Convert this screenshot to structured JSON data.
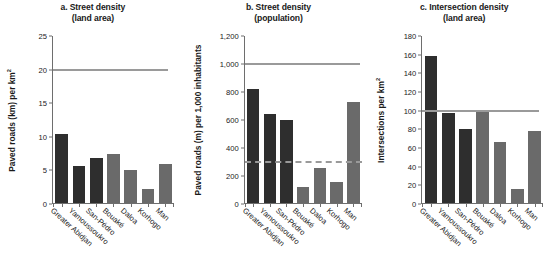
{
  "figure": {
    "categories": [
      "Greater Abidjan",
      "Yamoussoukro",
      "San-Pédro",
      "Bouaké",
      "Daloa",
      "Korhogo",
      "Man"
    ],
    "dark_color": "#2e2e2e",
    "light_color": "#6a6a6a",
    "reference_color": "#9a9a9a"
  },
  "chart_data": [
    {
      "type": "bar",
      "panel": "a",
      "title": "a. Street density",
      "subtitle": "(land area)",
      "ylabel": "Paved roads (km) per km",
      "ylabel_sup": "2",
      "xlabel": "",
      "categories": [
        "Greater Abidjan",
        "Yamoussoukro",
        "San-Pédro",
        "Bouaké",
        "Daloa",
        "Korhogo",
        "Man"
      ],
      "values": [
        10.4,
        5.6,
        6.7,
        7.3,
        5.0,
        2.1,
        5.9
      ],
      "bar_colors": [
        "dark",
        "dark",
        "dark",
        "light",
        "light",
        "light",
        "light"
      ],
      "ylim": [
        0,
        25
      ],
      "yticks": [
        0,
        5,
        10,
        15,
        20,
        25
      ],
      "ytick_labels": [
        "0",
        "5",
        "10",
        "15",
        "20",
        "25"
      ],
      "grid": false,
      "reference_lines": [
        {
          "value": 20,
          "style": "solid",
          "color": "#9a9a9a"
        }
      ]
    },
    {
      "type": "bar",
      "panel": "b",
      "title": "b. Street density",
      "subtitle": "(population)",
      "ylabel": "Paved roads (m) per 1,000 inhabitants",
      "ylabel_sup": "",
      "xlabel": "",
      "categories": [
        "Greater Abidjan",
        "Yamoussoukro",
        "San-Pédro",
        "Bouaké",
        "Daloa",
        "Korhogo",
        "Man"
      ],
      "values": [
        820,
        640,
        600,
        115,
        255,
        150,
        725
      ],
      "bar_colors": [
        "dark",
        "dark",
        "dark",
        "light",
        "light",
        "light",
        "light"
      ],
      "ylim": [
        0,
        1200
      ],
      "yticks": [
        0,
        200,
        400,
        600,
        800,
        1000,
        1200
      ],
      "ytick_labels": [
        "0",
        "200",
        "400",
        "600",
        "800",
        "1,000",
        "1,200"
      ],
      "grid": false,
      "reference_lines": [
        {
          "value": 1000,
          "style": "solid",
          "color": "#9a9a9a"
        },
        {
          "value": 300,
          "style": "dashed",
          "color": "#9a9a9a"
        }
      ]
    },
    {
      "type": "bar",
      "panel": "c",
      "title": "c. Intersection density",
      "subtitle": "(land area)",
      "ylabel": "Intersections per km",
      "ylabel_sup": "2",
      "xlabel": "",
      "categories": [
        "Greater Abidjan",
        "Yamoussoukro",
        "San-Pédro",
        "Bouaké",
        "Daloa",
        "Korhogo",
        "Man"
      ],
      "values": [
        158,
        97,
        80,
        98,
        66,
        15,
        78
      ],
      "bar_colors": [
        "dark",
        "dark",
        "dark",
        "light",
        "light",
        "light",
        "light"
      ],
      "ylim": [
        0,
        180
      ],
      "yticks": [
        0,
        20,
        40,
        60,
        80,
        100,
        120,
        140,
        160,
        180
      ],
      "ytick_labels": [
        "0",
        "20",
        "40",
        "60",
        "80",
        "100",
        "120",
        "140",
        "160",
        "180"
      ],
      "grid": false,
      "reference_lines": [
        {
          "value": 100,
          "style": "solid",
          "color": "#9a9a9a"
        }
      ]
    }
  ]
}
